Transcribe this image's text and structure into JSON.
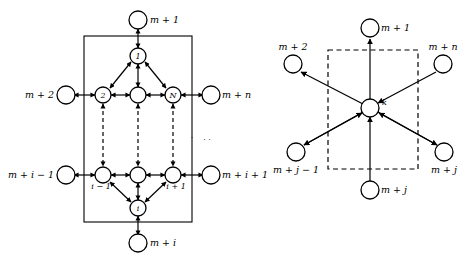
{
  "figure": {
    "background_color": "#ffffff",
    "ink_color": "#000000"
  },
  "left_panel": {
    "name": "left-network-panel",
    "frame_style": "solid-rectangle",
    "external_nodes": [
      {
        "id": "ext-top",
        "label": "m + 1",
        "cx": 138,
        "cy": 20,
        "label_x": 150,
        "label_y": 23,
        "anchor": "start"
      },
      {
        "id": "ext-left-upper",
        "label": "m + 2",
        "cx": 66,
        "cy": 95,
        "label_x": 54,
        "label_y": 98,
        "anchor": "end"
      },
      {
        "id": "ext-right-upper",
        "label": "m + n",
        "cx": 211,
        "cy": 95,
        "label_x": 222,
        "label_y": 98,
        "anchor": "start"
      },
      {
        "id": "ext-left-lower",
        "label": "m + i − 1",
        "cx": 66,
        "cy": 175,
        "label_x": 54,
        "label_y": 178,
        "anchor": "end"
      },
      {
        "id": "ext-right-lower",
        "label": "m + i + 1",
        "cx": 211,
        "cy": 175,
        "label_x": 222,
        "label_y": 178,
        "anchor": "start"
      },
      {
        "id": "ext-bottom",
        "label": "m + i",
        "cx": 138,
        "cy": 243,
        "label_x": 150,
        "label_y": 246,
        "anchor": "start"
      }
    ],
    "internal_nodes": [
      {
        "id": "node-1",
        "label": "1",
        "cx": 138,
        "cy": 56,
        "label_pos": "inside"
      },
      {
        "id": "node-2",
        "label": "2",
        "cx": 103,
        "cy": 95,
        "label_pos": "inside"
      },
      {
        "id": "node-center-upper",
        "label": "",
        "cx": 138,
        "cy": 95,
        "label_pos": "inside"
      },
      {
        "id": "node-N",
        "label": "N",
        "cx": 173,
        "cy": 95,
        "label_pos": "inside"
      },
      {
        "id": "node-i-minus-1",
        "label": "i − 1",
        "cx": 103,
        "cy": 175,
        "label_pos": "below"
      },
      {
        "id": "node-center-lower",
        "label": "",
        "cx": 138,
        "cy": 175,
        "label_pos": "below"
      },
      {
        "id": "node-i-plus-1",
        "label": "i + 1",
        "cx": 173,
        "cy": 175,
        "label_pos": "below"
      },
      {
        "id": "node-i",
        "label": "i",
        "cx": 138,
        "cy": 208,
        "label_pos": "inside"
      }
    ],
    "ellipsis_marks": [
      {
        "x": 192,
        "y": 138,
        "glyph": "·"
      },
      {
        "x": 206,
        "y": 140,
        "glyph": "· ·"
      }
    ]
  },
  "right_panel": {
    "name": "right-star-panel",
    "frame_style": "dashed-rectangle",
    "center_node": {
      "id": "node-k",
      "label": "k",
      "cx": 370,
      "cy": 108,
      "label_x": 382,
      "label_y": 104
    },
    "outer_nodes": [
      {
        "id": "r-ext-top",
        "label": "m + 1",
        "cx": 370,
        "cy": 28,
        "label_x": 381,
        "label_y": 31,
        "anchor": "start",
        "direction": "out"
      },
      {
        "id": "r-ext-upper-left",
        "label": "m + 2",
        "cx": 293,
        "cy": 64,
        "label_x": 293,
        "label_y": 49,
        "anchor": "middle",
        "direction": "out"
      },
      {
        "id": "r-ext-upper-right",
        "label": "m + n",
        "cx": 443,
        "cy": 64,
        "label_x": 443,
        "label_y": 49,
        "anchor": "middle",
        "direction": "in"
      },
      {
        "id": "r-ext-lower-left",
        "label": "m + j − 1",
        "cx": 296,
        "cy": 152,
        "label_x": 296,
        "label_y": 172,
        "anchor": "middle",
        "direction": "out"
      },
      {
        "id": "r-ext-lower-right",
        "label": "m + j",
        "cx": 444,
        "cy": 152,
        "label_x": 444,
        "label_y": 172,
        "anchor": "middle",
        "direction": "out"
      },
      {
        "id": "r-ext-bottom",
        "label": "m + j",
        "cx": 370,
        "cy": 190,
        "label_x": 381,
        "label_y": 193,
        "anchor": "start",
        "direction": "in"
      }
    ]
  }
}
